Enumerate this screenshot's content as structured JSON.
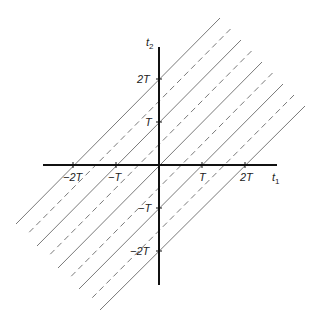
{
  "diagram": {
    "type": "line-lattice in t1-t2 plane",
    "axes": {
      "horizontal": {
        "name": "t",
        "subscript": "1"
      },
      "vertical": {
        "name": "t",
        "subscript": "2"
      }
    },
    "origin_px": [
      159,
      165
    ],
    "unit_T_px": 43,
    "x_ticks": [
      {
        "value": -2,
        "label": "−2T"
      },
      {
        "value": -1,
        "label": "−T"
      },
      {
        "value": 1,
        "label": "T"
      },
      {
        "value": 2,
        "label": "2T"
      }
    ],
    "y_ticks": [
      {
        "value": 2,
        "label": "2T"
      },
      {
        "value": 1,
        "label": "T"
      },
      {
        "value": -1,
        "label": "−T"
      },
      {
        "value": -2,
        "label": "−2T"
      }
    ],
    "lines": {
      "slope": 1,
      "description": "Parallel lines t2 = t1 + c",
      "offsets_T": [
        2,
        1.5,
        1,
        0.5,
        0,
        -0.5,
        -1,
        -1.5,
        -2
      ],
      "styles": [
        "solid",
        "dashed",
        "solid",
        "dashed",
        "solid",
        "dashed",
        "solid",
        "dashed",
        "solid"
      ],
      "color": "#7a7a7a"
    },
    "tick_labels": {
      "x_neg2": "−2T",
      "x_neg1": "−T",
      "x_pos1": "T",
      "x_pos2": "2T",
      "y_pos2": "2T",
      "y_pos1": "T",
      "y_neg1": "−T",
      "y_neg2": "−2T",
      "t1_main": "t",
      "t1_sub": "1",
      "t2_main": "t",
      "t2_sub": "2"
    }
  }
}
